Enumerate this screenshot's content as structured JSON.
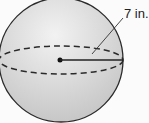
{
  "diagram": {
    "shape": "sphere",
    "radius_label": "7 in.",
    "fill_color": "#d2d2d2",
    "stroke_color": "#2a2a2a"
  }
}
